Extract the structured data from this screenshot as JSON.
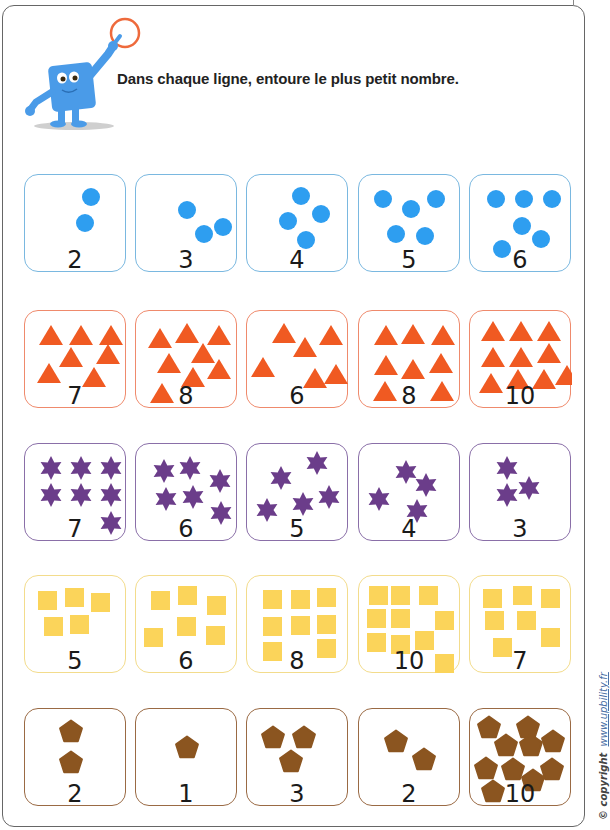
{
  "worksheet": {
    "instruction": "Dans chaque ligne, entoure le plus petit nombre.",
    "copyright_label": "© copyright",
    "copyright_site": "www.upbility.fr"
  },
  "colors": {
    "frame": "#666666",
    "dots": "#2e9ef0",
    "dots_border": "#7ab8e0",
    "triangles": "#f05a22",
    "triangles_border": "#ef8a6c",
    "stars": "#6b3d8a",
    "stars_border": "#8a6fa8",
    "squares": "#fbd45a",
    "squares_border": "#f3dc8c",
    "pentagons": "#8b5520",
    "pentagons_border": "#9a6a44",
    "mascot": "#4a9be8",
    "circle_ring": "#ee6a3c"
  },
  "rows": [
    {
      "shape": "dot",
      "cards": [
        {
          "number": "2",
          "count": 2
        },
        {
          "number": "3",
          "count": 3
        },
        {
          "number": "4",
          "count": 4
        },
        {
          "number": "5",
          "count": 5
        },
        {
          "number": "6",
          "count": 6
        }
      ]
    },
    {
      "shape": "triangle",
      "cards": [
        {
          "number": "7",
          "count": 7
        },
        {
          "number": "8",
          "count": 8
        },
        {
          "number": "6",
          "count": 6
        },
        {
          "number": "8",
          "count": 8
        },
        {
          "number": "10",
          "count": 10
        }
      ]
    },
    {
      "shape": "star",
      "cards": [
        {
          "number": "7",
          "count": 7
        },
        {
          "number": "6",
          "count": 6
        },
        {
          "number": "5",
          "count": 5
        },
        {
          "number": "4",
          "count": 4
        },
        {
          "number": "3",
          "count": 3
        }
      ]
    },
    {
      "shape": "square",
      "cards": [
        {
          "number": "5",
          "count": 5
        },
        {
          "number": "6",
          "count": 6
        },
        {
          "number": "8",
          "count": 8
        },
        {
          "number": "10",
          "count": 10
        },
        {
          "number": "7",
          "count": 7
        }
      ]
    },
    {
      "shape": "pentagon",
      "cards": [
        {
          "number": "2",
          "count": 2
        },
        {
          "number": "1",
          "count": 1
        },
        {
          "number": "3",
          "count": 3
        },
        {
          "number": "2",
          "count": 2
        },
        {
          "number": "10",
          "count": 10
        }
      ]
    }
  ]
}
